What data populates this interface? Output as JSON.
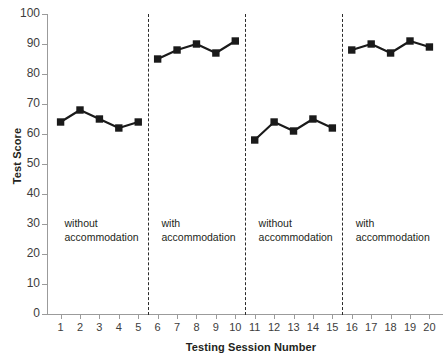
{
  "chart_data": {
    "type": "line",
    "title": "",
    "xlabel": "Testing Session Number",
    "ylabel": "Test Score",
    "xlim": [
      0.3,
      20.7
    ],
    "ylim": [
      0,
      100
    ],
    "ytick_step": 10,
    "grid": false,
    "legend": "none",
    "marker": "square",
    "color": "#1a1a1a",
    "x": [
      1,
      2,
      3,
      4,
      5,
      6,
      7,
      8,
      9,
      10,
      11,
      12,
      13,
      14,
      15,
      16,
      17,
      18,
      19,
      20
    ],
    "xticklabels": [
      "1",
      "2",
      "3",
      "4",
      "5",
      "6",
      "7",
      "8",
      "9",
      "10",
      "11",
      "12",
      "13",
      "14",
      "15",
      "16",
      "17",
      "18",
      "19",
      "20"
    ],
    "yticks": [
      0,
      10,
      20,
      30,
      40,
      50,
      60,
      70,
      80,
      90,
      100
    ],
    "yticklabels": [
      "0",
      "10",
      "20",
      "30",
      "40",
      "50",
      "60",
      "70",
      "80",
      "90",
      "100"
    ],
    "series": [
      {
        "name": "Test Score",
        "values": [
          64,
          68,
          65,
          62,
          64,
          85,
          88,
          90,
          87,
          91,
          58,
          64,
          61,
          65,
          62,
          88,
          90,
          87,
          91,
          89
        ]
      }
    ],
    "segments": [
      {
        "label": "without\naccommodation",
        "x_start": 1,
        "x_end": 5,
        "values": [
          64,
          68,
          65,
          62,
          64
        ]
      },
      {
        "label": "with\naccommodation",
        "x_start": 6,
        "x_end": 10,
        "values": [
          85,
          88,
          90,
          87,
          91
        ]
      },
      {
        "label": "without\naccommodation",
        "x_start": 11,
        "x_end": 15,
        "values": [
          58,
          64,
          61,
          65,
          62
        ]
      },
      {
        "label": "with\naccommodation",
        "x_start": 16,
        "x_end": 20,
        "values": [
          88,
          90,
          87,
          91,
          89
        ]
      }
    ],
    "phase_dividers_at_x": [
      5.5,
      10.5,
      15.5
    ],
    "annotations": [
      {
        "text": "without accommodation",
        "x": 1.2,
        "y": 30
      },
      {
        "text": "with accommodation",
        "x": 6.2,
        "y": 30
      },
      {
        "text": "without accommodation",
        "x": 11.2,
        "y": 30
      },
      {
        "text": "with accommodation",
        "x": 16.2,
        "y": 30
      }
    ]
  },
  "axes": {
    "y_title": "Test Score",
    "x_title": "Testing Session Number"
  },
  "colors": {
    "line": "#1a1a1a",
    "marker": "#1a1a1a",
    "axis": "#9b9b9b",
    "divider": "#2b2b2b",
    "tick_label": "#3d3d3d",
    "background": "#ffffff"
  }
}
